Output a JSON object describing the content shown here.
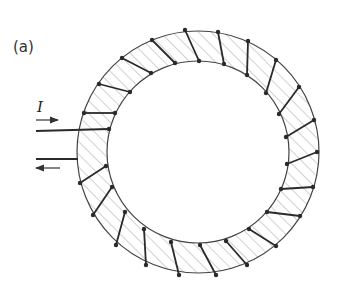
{
  "figure": {
    "panel_label": "(a)",
    "current_label": "I",
    "colors": {
      "outline": "#444444",
      "hatch": "#9a9a9a",
      "winding": "#2a2a2a",
      "background": "#ffffff"
    },
    "toroid": {
      "center": [
        198,
        152
      ],
      "outer_radius": 121,
      "inner_radius": 91
    },
    "leads": {
      "upper_wire": {
        "from": [
          36,
          131
        ],
        "to": [
          109,
          129
        ]
      },
      "lower_wire": {
        "from": [
          36,
          159
        ],
        "to": [
          78,
          159
        ]
      },
      "arrow_in": {
        "from": [
          36,
          120
        ],
        "to": [
          58,
          120
        ],
        "direction": "right"
      },
      "arrow_out": {
        "from": [
          60,
          168
        ],
        "to": [
          36,
          168
        ],
        "direction": "left"
      }
    },
    "windings": [
      {
        "outer": [
          84,
          113
        ],
        "inner": [
          115,
          113
        ]
      },
      {
        "outer": [
          99,
          84
        ],
        "inner": [
          130,
          92
        ]
      },
      {
        "outer": [
          122,
          58
        ],
        "inner": [
          151,
          73
        ]
      },
      {
        "outer": [
          152,
          40
        ],
        "inner": [
          175,
          63
        ]
      },
      {
        "outer": [
          185,
          30
        ],
        "inner": [
          199,
          61
        ]
      },
      {
        "outer": [
          218,
          32
        ],
        "inner": [
          224,
          64
        ]
      },
      {
        "outer": [
          248,
          41
        ],
        "inner": [
          247,
          75
        ]
      },
      {
        "outer": [
          276,
          60
        ],
        "inner": [
          266,
          93
        ]
      },
      {
        "outer": [
          299,
          87
        ],
        "inner": [
          279,
          114
        ]
      },
      {
        "outer": [
          314,
          120
        ],
        "inner": [
          286,
          137
        ]
      },
      {
        "outer": [
          317,
          152
        ],
        "inner": [
          287,
          164
        ]
      },
      {
        "outer": [
          313,
          187
        ],
        "inner": [
          281,
          189
        ]
      },
      {
        "outer": [
          300,
          216
        ],
        "inner": [
          267,
          212
        ]
      },
      {
        "outer": [
          276,
          246
        ],
        "inner": [
          249,
          229
        ]
      },
      {
        "outer": [
          247,
          265
        ],
        "inner": [
          226,
          241
        ]
      },
      {
        "outer": [
          216,
          275
        ],
        "inner": [
          200,
          245
        ]
      },
      {
        "outer": [
          179,
          275
        ],
        "inner": [
          171,
          242
        ]
      },
      {
        "outer": [
          146,
          265
        ],
        "inner": [
          144,
          229
        ]
      },
      {
        "outer": [
          116,
          245
        ],
        "inner": [
          125,
          212
        ]
      },
      {
        "outer": [
          93,
          215
        ],
        "inner": [
          112,
          187
        ]
      },
      {
        "outer": [
          80,
          183
        ],
        "inner": [
          106,
          166
        ]
      }
    ]
  }
}
